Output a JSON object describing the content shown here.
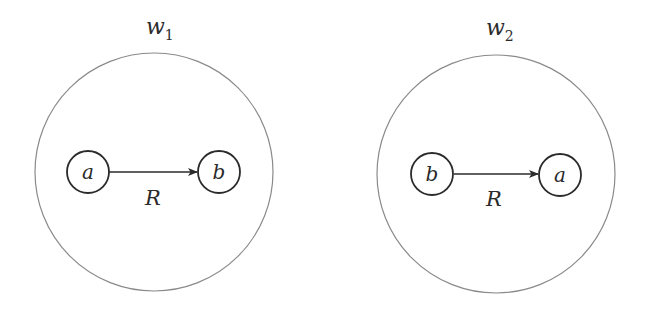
{
  "diagram": {
    "worlds": [
      {
        "name": "w",
        "subscript": "1",
        "nodes": [
          {
            "label": "a"
          },
          {
            "label": "b"
          }
        ],
        "edge": {
          "from": "a",
          "to": "b",
          "label": "R"
        }
      },
      {
        "name": "w",
        "subscript": "2",
        "nodes": [
          {
            "label": "b"
          },
          {
            "label": "a"
          }
        ],
        "edge": {
          "from": "b",
          "to": "a",
          "label": "R"
        }
      }
    ]
  }
}
